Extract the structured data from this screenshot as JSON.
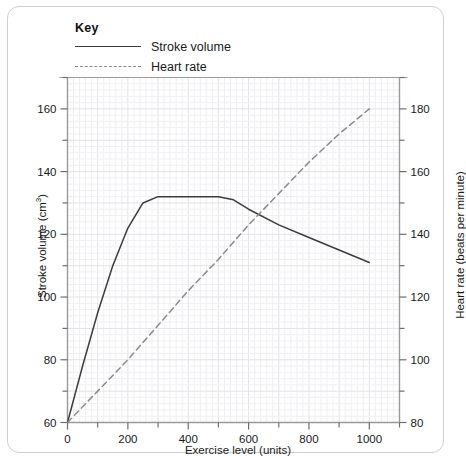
{
  "legend": {
    "title": "Key",
    "items": [
      {
        "label": "Stroke volume",
        "style": "solid",
        "color": "#3c3c3c"
      },
      {
        "label": "Heart rate",
        "style": "dashed",
        "color": "#8b8b8b"
      }
    ]
  },
  "chart_data": {
    "type": "line",
    "title": "",
    "xlabel": "Exercise level (units)",
    "ylabel": "Stroke volume (cm3)",
    "ylabel_right": "Heart rate (beats per minute)",
    "xlim": [
      0,
      1100
    ],
    "xticks": [
      0,
      200,
      400,
      600,
      800,
      1000
    ],
    "xticklabels": [
      "0",
      "200",
      "400",
      "600",
      "800",
      "1000"
    ],
    "ylim": [
      60,
      170
    ],
    "yticks": [
      60,
      80,
      100,
      120,
      140,
      160
    ],
    "yticklabels": [
      "60",
      "80",
      "100",
      "120",
      "140",
      "160"
    ],
    "ylim_right": [
      80,
      190
    ],
    "yticks_right": [
      80,
      100,
      120,
      140,
      160,
      180
    ],
    "yticklabels_right": [
      "80",
      "100",
      "120",
      "140",
      "160",
      "180"
    ],
    "minor_ticks": true,
    "grid": true,
    "legend_position": "above-plot",
    "series": [
      {
        "name": "Stroke volume",
        "axis": "left",
        "style": "solid",
        "color": "#3c3c3c",
        "points": [
          [
            0,
            60
          ],
          [
            50,
            78
          ],
          [
            100,
            95
          ],
          [
            150,
            110
          ],
          [
            200,
            122
          ],
          [
            250,
            130
          ],
          [
            300,
            132
          ],
          [
            350,
            132
          ],
          [
            400,
            132
          ],
          [
            450,
            132
          ],
          [
            500,
            132
          ],
          [
            550,
            131
          ],
          [
            600,
            128
          ],
          [
            700,
            123
          ],
          [
            800,
            119
          ],
          [
            900,
            115
          ],
          [
            1000,
            111
          ]
        ]
      },
      {
        "name": "Heart rate",
        "axis": "right",
        "style": "dashed",
        "color": "#8b8b8b",
        "points": [
          [
            0,
            80
          ],
          [
            100,
            90
          ],
          [
            200,
            100
          ],
          [
            300,
            111
          ],
          [
            400,
            122
          ],
          [
            500,
            132
          ],
          [
            600,
            143
          ],
          [
            700,
            153
          ],
          [
            800,
            163
          ],
          [
            900,
            172
          ],
          [
            1000,
            180
          ]
        ]
      }
    ]
  }
}
